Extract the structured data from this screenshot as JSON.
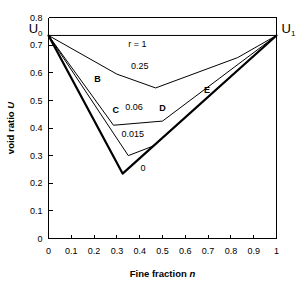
{
  "chart_data": {
    "type": "line",
    "title": "",
    "xlabel": "Fine fraction n",
    "xlabel_main": "Fine fraction",
    "xlabel_symbol": "n",
    "ylabel": "void ratio U",
    "ylabel_main": "void ratio",
    "ylabel_symbol": "U",
    "xlim": [
      0,
      1
    ],
    "ylim": [
      0,
      0.8
    ],
    "grid": false,
    "legend": "inline-curve-labels",
    "xticks": [
      "0",
      "0.1",
      "0.2",
      "0.3",
      "0.4",
      "0.5",
      "0.6",
      "0.7",
      "0.8",
      "0.9",
      "1"
    ],
    "xtick_values": [
      0,
      0.1,
      0.2,
      0.3,
      0.4,
      0.5,
      0.6,
      0.7,
      0.8,
      0.9,
      1
    ],
    "yticks": [
      "0",
      "0.1",
      "0.2",
      "0.3",
      "0.4",
      "0.5",
      "0.6",
      "0.7",
      "0.8"
    ],
    "ytick_values": [
      0,
      0.1,
      0.2,
      0.3,
      0.4,
      0.5,
      0.6,
      0.7,
      0.8
    ],
    "endpoints": {
      "U0": {
        "label": "U",
        "sub": "0",
        "n": 0,
        "U": 0.735
      },
      "U1": {
        "label": "U",
        "sub": "1",
        "n": 1,
        "U": 0.735
      }
    },
    "series": [
      {
        "name": "r = 1",
        "label": "r = 1",
        "x": [
          0,
          1
        ],
        "y": [
          0.735,
          0.735
        ],
        "bold": false
      },
      {
        "name": "0.25",
        "label": "0.25",
        "x": [
          0,
          0.3,
          0.47,
          0.83,
          1
        ],
        "y": [
          0.735,
          0.595,
          0.545,
          0.655,
          0.735
        ],
        "bold": false
      },
      {
        "name": "0.06",
        "label": "0.06",
        "x": [
          0,
          0.285,
          0.5,
          1
        ],
        "y": [
          0.735,
          0.41,
          0.425,
          0.735
        ],
        "bold": false
      },
      {
        "name": "0.015",
        "label": "0.015",
        "x": [
          0,
          0.35,
          0.46,
          1
        ],
        "y": [
          0.735,
          0.3,
          0.335,
          0.735
        ],
        "bold": false
      },
      {
        "name": "0",
        "label": "0",
        "x": [
          0,
          0.325,
          1
        ],
        "y": [
          0.735,
          0.235,
          0.735
        ],
        "bold": true
      }
    ],
    "annotations": [
      {
        "text": "r = 1",
        "n": 0.39,
        "U": 0.695,
        "kind": "curve-label"
      },
      {
        "text": "0.25",
        "n": 0.4,
        "U": 0.615,
        "kind": "curve-label"
      },
      {
        "text": "B",
        "n": 0.215,
        "U": 0.565,
        "kind": "point-label"
      },
      {
        "text": "C",
        "n": 0.295,
        "U": 0.455,
        "kind": "point-label"
      },
      {
        "text": "0.06",
        "n": 0.375,
        "U": 0.465,
        "kind": "curve-label"
      },
      {
        "text": "D",
        "n": 0.5,
        "U": 0.462,
        "kind": "point-label"
      },
      {
        "text": "E",
        "n": 0.695,
        "U": 0.525,
        "kind": "point-label"
      },
      {
        "text": "0.015",
        "n": 0.37,
        "U": 0.368,
        "kind": "curve-label"
      },
      {
        "text": "0",
        "n": 0.415,
        "U": 0.245,
        "kind": "curve-label"
      }
    ],
    "colors": {
      "axis": "#000000",
      "curve": "#000000",
      "background": "#ffffff"
    }
  }
}
